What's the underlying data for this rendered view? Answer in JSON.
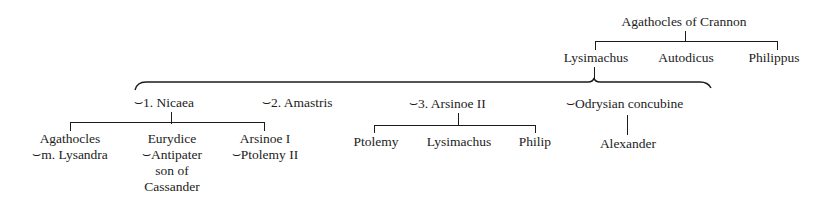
{
  "diagram": {
    "type": "family-tree",
    "root": {
      "name": "Agathocles of Crannon",
      "children": [
        "Lysimachus",
        "Autodicus",
        "Philippus"
      ]
    },
    "lysimachus_spouses": [
      {
        "label": "1. Nicaea",
        "children": [
          {
            "name": "Agathocles",
            "spouse_line": "m. Lysandra"
          },
          {
            "name": "Eurydice",
            "spouse_line": "Antipater",
            "extra_lines": [
              "son of",
              "Cassander"
            ]
          },
          {
            "name": "Arsinoe I",
            "spouse_line": "Ptolemy II"
          }
        ]
      },
      {
        "label": "2. Amastris",
        "children": []
      },
      {
        "label": "3. Arsinoe II",
        "children": [
          {
            "name": "Ptolemy"
          },
          {
            "name": "Lysimachus"
          },
          {
            "name": "Philip"
          }
        ]
      },
      {
        "label": "Odrysian concubine",
        "children": [
          {
            "name": "Alexander"
          }
        ]
      }
    ],
    "marriage_symbol": "⌣"
  }
}
